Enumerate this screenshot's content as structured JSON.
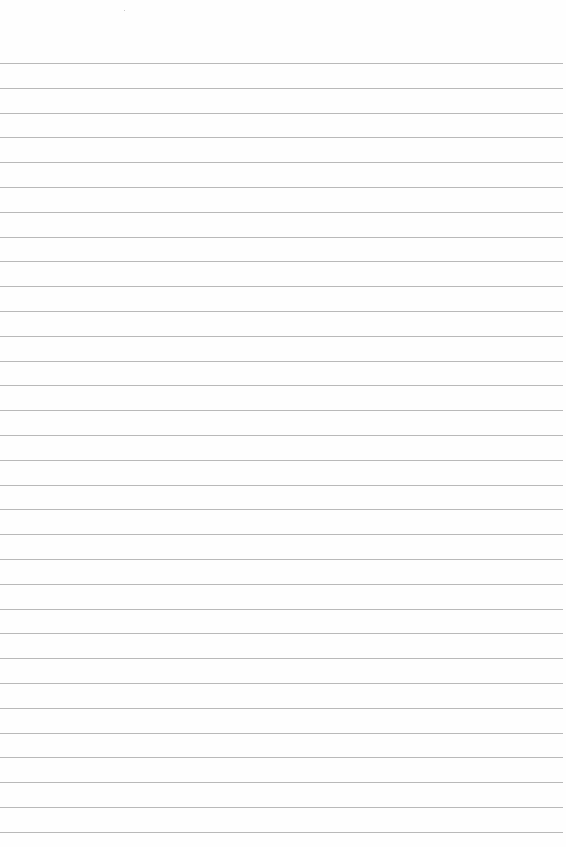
{
  "page": {
    "type": "lined-paper",
    "background_color": "#fefefe",
    "line_color": "#b9b9b9",
    "line_count": 32,
    "first_line_y": 63,
    "line_spacing": 24.8,
    "line_width": 563
  }
}
